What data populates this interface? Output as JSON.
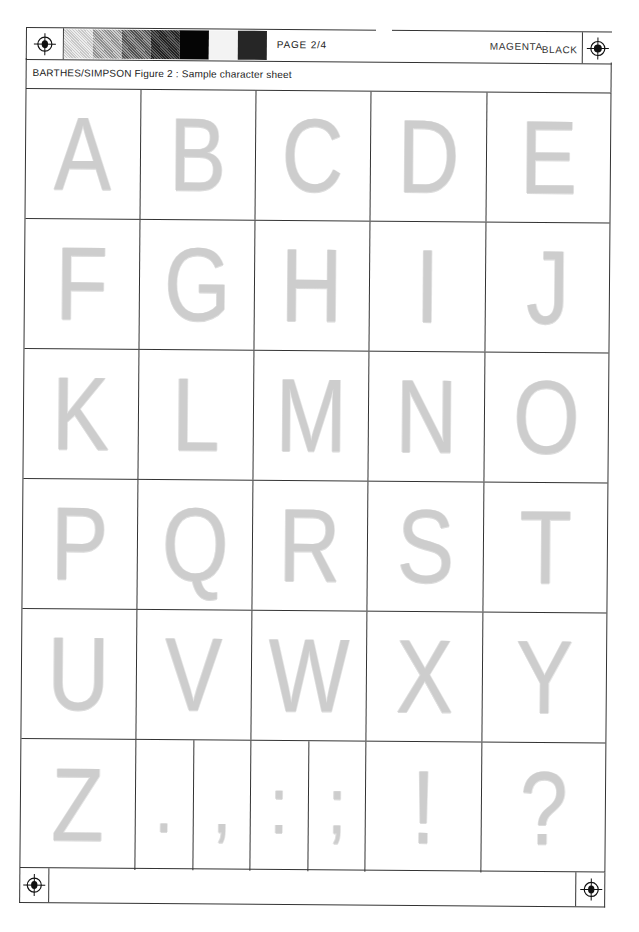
{
  "header": {
    "page_label": "PAGE 2/4",
    "plates": [
      {
        "label": "MAGENTA"
      },
      {
        "label": "BLACK"
      }
    ],
    "swatches": [
      {
        "color": "#d6d6d6",
        "width": 29
      },
      {
        "color": "#a9a9a9",
        "width": 29
      },
      {
        "color": "#6e6e6e",
        "width": 29
      },
      {
        "color": "#3c3c3c",
        "width": 29
      },
      {
        "color": "#050505",
        "width": 29
      },
      {
        "color": "#f3f3f3",
        "width": 29
      },
      {
        "color": "#262626",
        "width": 29
      }
    ],
    "registration_marks": [
      "registration-target-left",
      "registration-target-right"
    ]
  },
  "caption": {
    "text": "BARTHES/SIMPSON Figure 2 : Sample character sheet"
  },
  "grid": {
    "rows": [
      {
        "cells": [
          {
            "char": "A"
          },
          {
            "char": "B"
          },
          {
            "char": "C"
          },
          {
            "char": "D"
          },
          {
            "char": "E"
          }
        ]
      },
      {
        "cells": [
          {
            "char": "F"
          },
          {
            "char": "G"
          },
          {
            "char": "H"
          },
          {
            "char": "I"
          },
          {
            "char": "J"
          }
        ]
      },
      {
        "cells": [
          {
            "char": "K"
          },
          {
            "char": "L"
          },
          {
            "char": "M"
          },
          {
            "char": "N"
          },
          {
            "char": "O"
          }
        ]
      },
      {
        "cells": [
          {
            "char": "P"
          },
          {
            "char": "Q"
          },
          {
            "char": "R"
          },
          {
            "char": "S"
          },
          {
            "char": "T"
          }
        ]
      },
      {
        "cells": [
          {
            "char": "U"
          },
          {
            "char": "V"
          },
          {
            "char": "W"
          },
          {
            "char": "X"
          },
          {
            "char": "Y"
          }
        ]
      },
      {
        "cells": [
          {
            "char": "Z"
          },
          {
            "char": "."
          },
          {
            "char": ","
          },
          {
            "char": ":"
          },
          {
            "char": ";"
          },
          {
            "char": "!"
          },
          {
            "char": "?"
          }
        ]
      }
    ]
  },
  "footer": {
    "registration_marks": [
      "registration-target-bottom-left",
      "registration-target-bottom-right"
    ]
  }
}
